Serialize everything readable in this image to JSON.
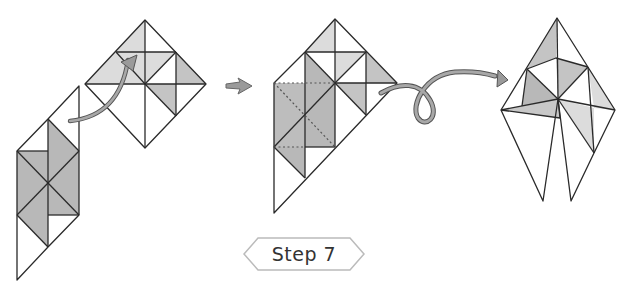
{
  "diagram": {
    "step_label": "Step 7",
    "colors": {
      "line": "#2a2a2a",
      "shade_dark": "#b8b8b8",
      "shade_light": "#dcdcdc",
      "arrow_fill": "#9a9a9a",
      "arrow_stroke": "#555555",
      "badge_border": "#bbbbbb"
    },
    "figures": [
      {
        "id": "before",
        "description": "Partially folded model with lower strip to be folded up along arrow"
      },
      {
        "id": "middle",
        "description": "Model after fold with dotted crease square"
      },
      {
        "id": "result",
        "description": "Resulting kite-shaped model"
      }
    ],
    "arrows": [
      {
        "id": "fold-up-arrow",
        "type": "curved-fold"
      },
      {
        "id": "next-arrow",
        "type": "sequence"
      },
      {
        "id": "turn-over-arrow",
        "type": "loop"
      }
    ]
  }
}
